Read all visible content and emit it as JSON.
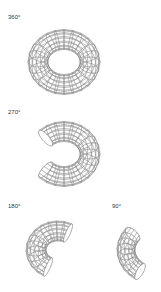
{
  "diagram": {
    "panels": [
      {
        "label": "360°",
        "sweep_degrees": 360
      },
      {
        "label": "270°",
        "sweep_degrees": 270
      },
      {
        "label": "180°",
        "sweep_degrees": 180
      },
      {
        "label": "90°",
        "sweep_degrees": 90
      }
    ],
    "colors": {
      "background": "#ffffff",
      "line": "#8a8a8a",
      "text": "#333333"
    }
  }
}
